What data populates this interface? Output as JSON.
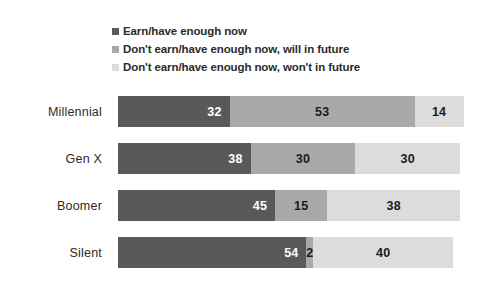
{
  "chart_data": {
    "type": "bar",
    "orientation": "horizontal",
    "stacked": true,
    "stack_mode": "percent",
    "title": "",
    "subtitle": "",
    "xlabel": "",
    "ylabel": "",
    "xlim": [
      0,
      100
    ],
    "grid": false,
    "legend_position": "top",
    "categories": [
      "Millennial",
      "Gen X",
      "Boomer",
      "Silent"
    ],
    "series": [
      {
        "name": "Earn/have enough now",
        "color": "#595959",
        "label_color": "#ffffff",
        "values": [
          32,
          38,
          45,
          54
        ]
      },
      {
        "name": "Don't earn/have enough now, will in future",
        "color": "#a9a9a9",
        "label_color": "#1a1a1a",
        "values": [
          53,
          30,
          15,
          2
        ]
      },
      {
        "name": "Don't earn/have enough now, won't in future",
        "color": "#dcdcdc",
        "label_color": "#1a1a1a",
        "values": [
          14,
          30,
          38,
          40
        ]
      }
    ],
    "data_labels": [
      [
        "32",
        "53",
        "14"
      ],
      [
        "38",
        "30",
        "30"
      ],
      [
        "45",
        "15",
        "38"
      ],
      [
        "54",
        "2",
        "40"
      ]
    ]
  },
  "legend": {
    "items": [
      {
        "label": "Earn/have enough now",
        "color": "#595959"
      },
      {
        "label": "Don't earn/have enough now, will in future",
        "color": "#a9a9a9"
      },
      {
        "label": "Don't earn/have enough now, won't in future",
        "color": "#dcdcdc"
      }
    ]
  },
  "axis": {
    "category_labels": [
      "Millennial",
      "Gen X",
      "Boomer",
      "Silent"
    ]
  },
  "colors": {
    "background": "#ffffff",
    "text": "#2b2b2b",
    "series_dark": "#595959",
    "series_medium": "#a9a9a9",
    "series_light": "#dcdcdc"
  }
}
